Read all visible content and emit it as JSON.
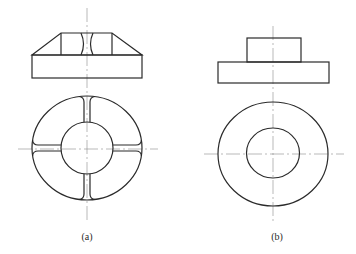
{
  "figure": {
    "panels": [
      {
        "id": "a",
        "caption": "(a)",
        "description": "Ring with four radial ribs and flared slot ends; front view shows chamfered (trapezoidal) boss on rectangular base with central slot",
        "front_view": {
          "base_rect": {
            "x": 32,
            "y": 55,
            "w": 110,
            "h": 23
          },
          "trapezoid_top": {
            "x1": 61,
            "x2": 112,
            "y": 33
          }
        },
        "top_view": {
          "center": [
            87,
            148
          ],
          "outer_radius": 52,
          "inner_radius": 26,
          "rib_count": 4
        }
      },
      {
        "id": "b",
        "caption": "(b)",
        "description": "Plain ring; front view shows cylindrical boss on rectangular base",
        "front_view": {
          "base_rect": {
            "x": 218,
            "y": 62,
            "w": 111,
            "h": 21
          },
          "boss_rect": {
            "x": 247,
            "y": 38,
            "w": 54,
            "h": 24
          }
        },
        "top_view": {
          "center": [
            273,
            154
          ],
          "outer_radius": 53,
          "inner_radius": 26
        }
      }
    ],
    "line_color": "#2a2a2a",
    "centerline_color": "#8a8a8a"
  }
}
